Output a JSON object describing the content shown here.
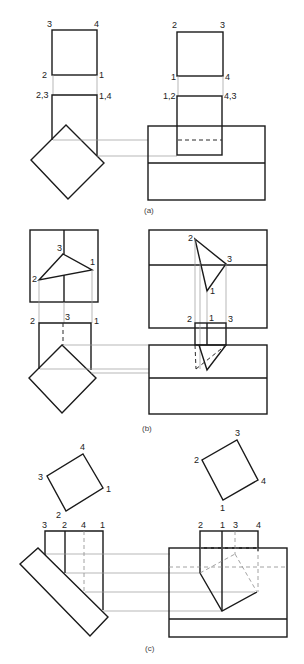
{
  "figure": {
    "panels": [
      {
        "id": "a",
        "caption": "(a)",
        "left_view": {
          "top_square_labels": [
            "3",
            "4",
            "2",
            "1"
          ],
          "lower_rect_labels": [
            "2,3",
            "1,4"
          ]
        },
        "right_view": {
          "top_square_labels": [
            "2",
            "3",
            "1",
            "4"
          ],
          "lower_rect_labels": [
            "1,2",
            "4,3"
          ]
        }
      },
      {
        "id": "b",
        "caption": "(b)",
        "left_view": {
          "triangle_labels": [
            "3",
            "1",
            "2"
          ],
          "lower_labels": [
            "2",
            "3",
            "1"
          ]
        },
        "right_view": {
          "triangle_labels": [
            "2",
            "3",
            "1"
          ],
          "lower_labels": [
            "2",
            "1",
            "3"
          ]
        }
      },
      {
        "id": "c",
        "caption": "(c)",
        "left_view": {
          "square_labels": [
            "4",
            "3",
            "1",
            "2"
          ],
          "top_labels": [
            "3",
            "2",
            "4",
            "1"
          ]
        },
        "right_view": {
          "square_labels": [
            "3",
            "2",
            "4",
            "1"
          ],
          "top_labels": [
            "2",
            "1",
            "3",
            "4"
          ]
        }
      }
    ]
  }
}
